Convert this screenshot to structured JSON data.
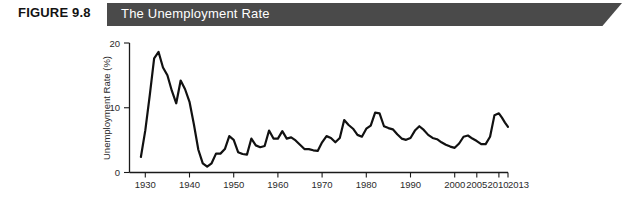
{
  "figure": {
    "number_label": "FIGURE 9.8",
    "banner_title": "The Unemployment Rate",
    "banner_color": "#4a4a4a",
    "number_color": "#131313",
    "title_color": "#ffffff"
  },
  "axes": {
    "ylabel": "Unemployment Rate (%)",
    "xlabel": "Year",
    "y_ticks": [
      "0",
      "10",
      "20"
    ],
    "x_ticks": [
      "1930",
      "1940",
      "1950",
      "1960",
      "1970",
      "1980",
      "1990",
      "2000",
      "2005",
      "2010",
      "2013"
    ]
  },
  "chart_data": {
    "type": "line",
    "title": "The Unemployment Rate",
    "xlabel": "Year",
    "ylabel": "Unemployment Rate (%)",
    "xlim": [
      1929,
      2013
    ],
    "ylim": [
      0,
      21
    ],
    "grid": false,
    "legend": "none",
    "line_color": "#111111",
    "x_tick_values": [
      1930,
      1940,
      1950,
      1960,
      1970,
      1980,
      1990,
      2000,
      2005,
      2010,
      2013
    ],
    "x_axis_scale": "non-uniform: decades 1930-1990, then 2000, 2005, 2010, 2013",
    "y_tick_values": [
      0,
      10,
      20
    ],
    "series": [
      {
        "name": "Unemployment Rate",
        "x": [
          1929,
          1930,
          1931,
          1932,
          1933,
          1934,
          1935,
          1936,
          1937,
          1938,
          1939,
          1940,
          1941,
          1942,
          1943,
          1944,
          1945,
          1946,
          1947,
          1948,
          1949,
          1950,
          1951,
          1952,
          1953,
          1954,
          1955,
          1956,
          1957,
          1958,
          1959,
          1960,
          1961,
          1962,
          1963,
          1964,
          1965,
          1966,
          1967,
          1968,
          1969,
          1970,
          1971,
          1972,
          1973,
          1974,
          1975,
          1976,
          1977,
          1978,
          1979,
          1980,
          1981,
          1982,
          1983,
          1984,
          1985,
          1986,
          1987,
          1988,
          1989,
          1990,
          1991,
          1992,
          1993,
          1994,
          1995,
          1996,
          1997,
          1998,
          1999,
          2000,
          2001,
          2002,
          2003,
          2004,
          2005,
          2006,
          2007,
          2008,
          2009,
          2010,
          2011,
          2012,
          2013
        ],
        "values": [
          3.2,
          8.7,
          15.9,
          23.6,
          24.9,
          21.7,
          20.1,
          16.9,
          14.3,
          19.0,
          17.2,
          14.6,
          9.9,
          4.7,
          1.9,
          1.2,
          1.9,
          3.9,
          3.9,
          3.8,
          5.9,
          5.3,
          3.3,
          3.0,
          2.9,
          5.5,
          4.4,
          4.1,
          4.3,
          6.8,
          5.5,
          5.5,
          6.7,
          5.5,
          5.7,
          5.2,
          4.5,
          3.8,
          3.8,
          3.6,
          3.5,
          4.9,
          5.9,
          5.6,
          4.9,
          5.6,
          8.5,
          7.7,
          7.1,
          6.1,
          5.8,
          7.1,
          7.6,
          9.7,
          9.6,
          7.5,
          7.2,
          7.0,
          6.2,
          5.5,
          5.3,
          5.6,
          6.8,
          7.5,
          6.9,
          6.1,
          5.6,
          5.4,
          4.9,
          4.5,
          4.2,
          4.0,
          4.7,
          5.8,
          6.0,
          5.5,
          5.1,
          4.6,
          4.6,
          5.8,
          9.3,
          9.6,
          8.9,
          8.1,
          7.4
        ]
      }
    ],
    "annotations": [
      {
        "label": "Great Depression peak",
        "year": 1933,
        "value": 24.9
      },
      {
        "label": "1982-83 recession peak",
        "year": 1982,
        "value": 9.7
      },
      {
        "label": "Great Recession peak",
        "year": 2010,
        "value": 9.6
      }
    ]
  },
  "page_bleed_text": ""
}
